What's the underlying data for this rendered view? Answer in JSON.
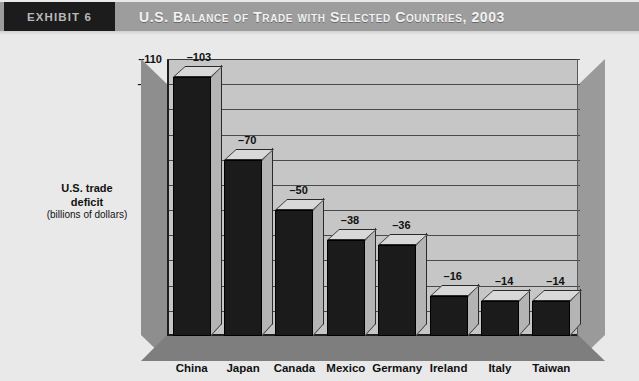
{
  "header": {
    "exhibit_label": "EXHIBIT 6",
    "title": "U.S. Balance of Trade with Selected Countries, 2003"
  },
  "chart_data": {
    "type": "bar",
    "title": "U.S. Balance of Trade with Selected Countries, 2003",
    "categories": [
      "China",
      "Japan",
      "Canada",
      "Mexico",
      "Germany",
      "Ireland",
      "Italy",
      "Taiwan"
    ],
    "values": [
      -103,
      -70,
      -50,
      -38,
      -36,
      -16,
      -14,
      -14
    ],
    "data_labels": [
      "–103",
      "–70",
      "–50",
      "–38",
      "–36",
      "–16",
      "–14",
      "–14"
    ],
    "xlabel": "",
    "ylabel": "U.S. trade deficit (billions of dollars)",
    "ylabel_line1": "U.S. trade",
    "ylabel_line2": "deficit",
    "ylabel_line3": "(billions of dollars)",
    "ylim": [
      -110,
      0
    ],
    "ytick_values": [
      -110,
      -100,
      -90,
      -80,
      -70,
      -60,
      -50,
      -40,
      -30,
      -20,
      -10,
      0
    ],
    "ytick_labels": [
      "–110",
      "–100",
      "–90",
      "–80",
      "–70",
      "–60",
      "–50",
      "–40",
      "–30",
      "–20",
      "–10",
      "0"
    ],
    "grid": true,
    "legend": "none",
    "style": "3d-column",
    "colors": {
      "bar_front": "#1b1b1b",
      "bar_top": "#d8d8d8",
      "bar_side": "#b4b4b4",
      "plot_background": "#c6c6c6",
      "page_background": "#e9e9e9",
      "header_background": "#9d9d9d",
      "exhibit_background": "#1c1c1c",
      "gridline": "#4a4a4a"
    }
  }
}
